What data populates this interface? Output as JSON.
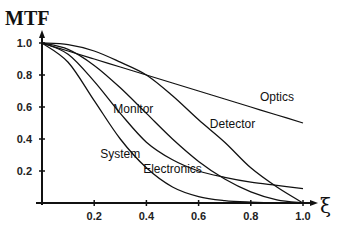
{
  "chart_data": {
    "type": "line",
    "title": "",
    "ylabel": "MTF",
    "xlabel": "ξ",
    "xlim": [
      0,
      1.0
    ],
    "ylim": [
      0,
      1.0
    ],
    "grid": false,
    "legend": "inline labels",
    "x_ticks": [
      "0.2",
      "0.4",
      "0.6",
      "0.8",
      "1.0"
    ],
    "y_ticks": [
      "0.2",
      "0.4",
      "0.6",
      "0.8",
      "1.0"
    ],
    "x": [
      0,
      0.1,
      0.2,
      0.3,
      0.4,
      0.5,
      0.6,
      0.7,
      0.8,
      0.9,
      1.0
    ],
    "series": [
      {
        "name": "Optics",
        "values": [
          1,
          0.95,
          0.9,
          0.85,
          0.8,
          0.75,
          0.7,
          0.65,
          0.6,
          0.55,
          0.5
        ]
      },
      {
        "name": "Detector",
        "values": [
          1,
          0.99,
          0.95,
          0.88,
          0.8,
          0.67,
          0.52,
          0.38,
          0.22,
          0.1,
          0
        ]
      },
      {
        "name": "Monitor",
        "values": [
          1,
          0.96,
          0.86,
          0.72,
          0.56,
          0.4,
          0.26,
          0.15,
          0.07,
          0.02,
          0
        ]
      },
      {
        "name": "Electronics",
        "values": [
          1,
          0.93,
          0.76,
          0.56,
          0.38,
          0.27,
          0.2,
          0.16,
          0.13,
          0.11,
          0.09
        ]
      },
      {
        "name": "System",
        "values": [
          1,
          0.88,
          0.64,
          0.4,
          0.22,
          0.1,
          0.04,
          0.015,
          0.005,
          0,
          0
        ]
      }
    ],
    "annotations": [
      {
        "text": "Optics",
        "x": 0.9,
        "y": 0.64
      },
      {
        "text": "Detector",
        "x": 0.73,
        "y": 0.47
      },
      {
        "text": "Monitor",
        "x": 0.35,
        "y": 0.56
      },
      {
        "text": "Electronics",
        "x": 0.5,
        "y": 0.19
      },
      {
        "text": "System",
        "x": 0.3,
        "y": 0.28
      }
    ]
  }
}
